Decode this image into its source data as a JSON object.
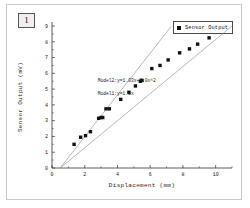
{
  "panel": {
    "label": "1"
  },
  "legend": {
    "marker": "filled-square-marker",
    "entries": [
      {
        "label": "Sensor Output"
      }
    ]
  },
  "colors": {
    "marker": "#111111",
    "line": "#9a9a9a",
    "axis": "#333333",
    "frame": "#c9c9c9",
    "panel_bg": "#efefef"
  },
  "chart_data": {
    "type": "scatter",
    "title": "",
    "xlabel": "Displacement (mm)",
    "ylabel": "Sensor Output (mV)",
    "xlim": [
      0,
      11
    ],
    "ylim": [
      0,
      9
    ],
    "xticks": [
      0,
      2,
      4,
      6,
      8,
      10
    ],
    "yticks": [
      0,
      1,
      2,
      3,
      4,
      5,
      6,
      7,
      8,
      9
    ],
    "grid": false,
    "legend_position": "top-right",
    "series": [
      {
        "name": "Sensor Output",
        "type": "scatter",
        "marker": "square",
        "x": [
          1.35,
          1.75,
          2.05,
          2.35,
          2.85,
          3.0,
          3.1,
          3.3,
          3.5,
          4.2,
          4.7,
          5.1,
          5.4,
          5.5,
          6.1,
          6.6,
          7.1,
          7.8,
          8.4,
          8.9,
          9.6
        ],
        "y": [
          1.5,
          1.95,
          2.05,
          2.3,
          3.15,
          3.2,
          3.2,
          3.75,
          3.75,
          4.35,
          4.8,
          5.2,
          5.5,
          5.55,
          6.3,
          6.5,
          6.85,
          7.3,
          7.55,
          7.85,
          8.25
        ]
      },
      {
        "name": "Model1",
        "type": "line",
        "equation": "Model1:y=1.2x",
        "x": [
          0.5,
          7.3
        ],
        "y": [
          0.0,
          9.0
        ]
      },
      {
        "name": "Model2",
        "type": "line",
        "equation": "Model2:y=1.03x+0.0x^2",
        "x": [
          0.5,
          11.0
        ],
        "y": [
          0.0,
          9.0
        ]
      }
    ],
    "annotations": [
      {
        "text": "Model2:y=1.03x+0.0x^2",
        "x": 2.8,
        "y": 5.45
      },
      {
        "text": "Model1:y=1.2x",
        "x": 2.8,
        "y": 4.6
      }
    ]
  }
}
